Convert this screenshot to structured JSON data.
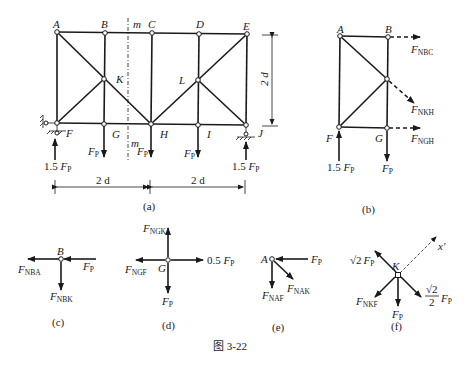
{
  "figure": {
    "caption": "图 3-22",
    "panels": {
      "a": {
        "label": "(a)",
        "nodes": [
          "A",
          "B",
          "C",
          "D",
          "E",
          "F",
          "G",
          "H",
          "I",
          "J",
          "K",
          "L"
        ],
        "section_label": "m",
        "height_dim": "2 d",
        "span_left": "2 d",
        "span_right": "2 d",
        "loads": [
          "F_P",
          "F_P",
          "F_P"
        ],
        "reaction_left": "1.5 F_P",
        "reaction_right": "1.5 F_P"
      },
      "b": {
        "label": "(b)",
        "nodes": [
          "A",
          "B",
          "F",
          "G"
        ],
        "forces": [
          "F_NBC",
          "F_NKH",
          "F_NGH"
        ],
        "reaction": "1.5 F_P",
        "load": "F_P"
      },
      "c": {
        "label": "(c)",
        "node": "B",
        "forces": [
          "F_NBA",
          "F_P",
          "F_NBK"
        ]
      },
      "d": {
        "label": "(d)",
        "node": "G",
        "forces": [
          "F_NGK",
          "F_NGF",
          "0.5 F_P",
          "F_P"
        ]
      },
      "e": {
        "label": "(e)",
        "node": "A",
        "forces": [
          "F_P",
          "F_NAF",
          "F_NAK"
        ]
      },
      "f": {
        "label": "(f)",
        "node": "K",
        "axis": "x'",
        "forces": [
          "√2 F_P",
          "F_NKF",
          "F_P",
          "√2/2 F_P"
        ]
      }
    }
  },
  "text": {
    "A": "A",
    "B": "B",
    "C": "C",
    "D": "D",
    "E": "E",
    "F": "F",
    "G": "G",
    "H": "H",
    "I": "I",
    "J": "J",
    "K": "K",
    "L": "L",
    "m": "m",
    "two_d": "2 d",
    "P": "P",
    "N": "N",
    "onefive": "1.5 ",
    "half": "0.5 ",
    "BC": "NBC",
    "KH": "NKH",
    "GH": "NGH",
    "BA": "NBA",
    "BK": "NBK",
    "GK": "NGK",
    "GF": "NGF",
    "AF": "NAF",
    "AK": "NAK",
    "KF": "NKF",
    "sqrt2": "√2",
    "two": "2",
    "xprime": "x'",
    "cap_a": "(a)",
    "cap_b": "(b)",
    "cap_c": "(c)",
    "cap_d": "(d)",
    "cap_e": "(e)",
    "cap_f": "(f)",
    "caption": "图 3-22"
  }
}
